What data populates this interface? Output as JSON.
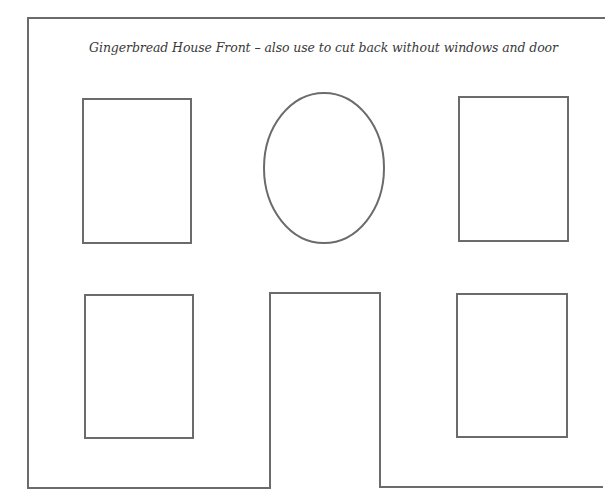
{
  "document": {
    "title": "Gingerbread House Front – also use to cut back without windows and door"
  },
  "template": {
    "stroke_color": "#6b6b6b",
    "background": "#ffffff",
    "shapes": {
      "outline": "house-front-outline-with-door-opening",
      "windows": [
        "upper-left",
        "upper-right",
        "lower-left",
        "lower-right"
      ],
      "oval_window": "center-oval",
      "door": "center-door"
    }
  }
}
